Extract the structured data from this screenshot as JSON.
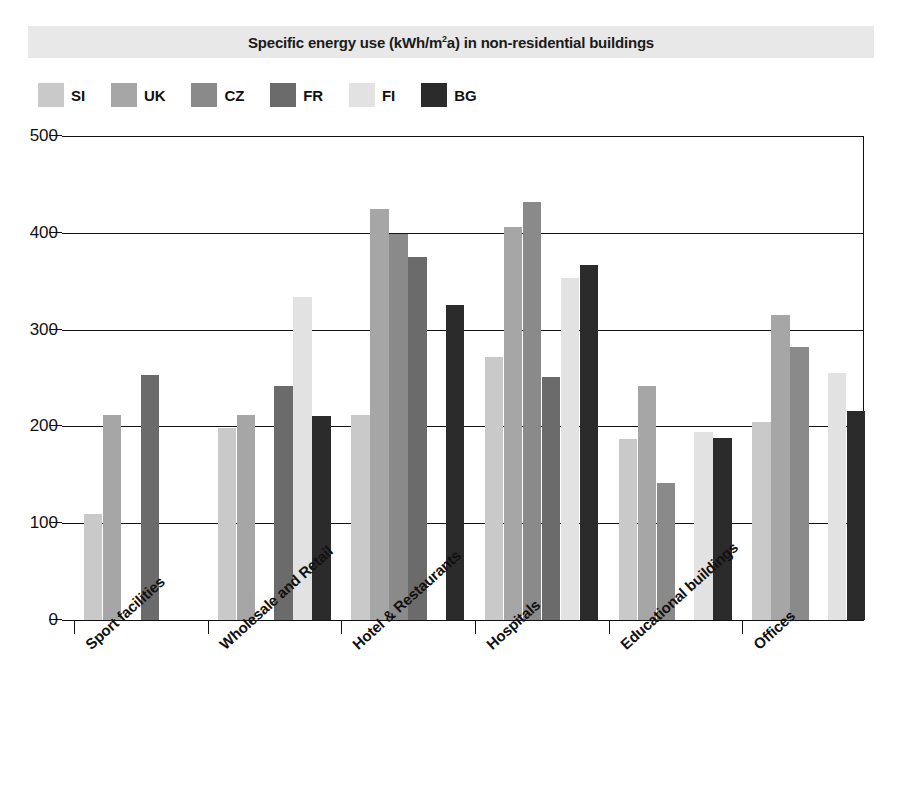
{
  "chart": {
    "title_prefix": "Specific energy use (kWh/m",
    "title_sup": "2",
    "title_suffix": "a) in non-residential  buildings",
    "title_full": "Specific energy use (kWh/m2a) in non-residential  buildings"
  },
  "legend": {
    "position": "top-left",
    "items": [
      {
        "label": "SI",
        "color": "#c9c9c9"
      },
      {
        "label": "UK",
        "color": "#a6a6a6"
      },
      {
        "label": "CZ",
        "color": "#8a8a8a"
      },
      {
        "label": "FR",
        "color": "#6b6b6b"
      },
      {
        "label": "FI",
        "color": "#e2e2e2"
      },
      {
        "label": "BG",
        "color": "#2b2b2b"
      }
    ]
  },
  "yaxis": {
    "ticks": [
      "0",
      "100",
      "200",
      "300",
      "400",
      "500"
    ],
    "min": 0,
    "max": 500,
    "step": 100
  },
  "chart_data": {
    "type": "bar",
    "title": "Specific energy use (kWh/m2a) in non-residential  buildings",
    "xlabel": "",
    "ylabel": "",
    "ylim": [
      0,
      500
    ],
    "grid": true,
    "legend_position": "top-left",
    "categories": [
      "Sport facilities",
      "Wholesale and Retail",
      "Hotel & Restaurants",
      "Hospitals",
      "Educational buildings",
      "Offices"
    ],
    "series": [
      {
        "name": "SI",
        "color": "#c9c9c9",
        "values": [
          110,
          198,
          212,
          272,
          187,
          205
        ]
      },
      {
        "name": "UK",
        "color": "#a6a6a6",
        "values": [
          212,
          212,
          425,
          406,
          242,
          315
        ]
      },
      {
        "name": "CZ",
        "color": "#8a8a8a",
        "values": [
          null,
          null,
          399,
          432,
          142,
          282
        ]
      },
      {
        "name": "FR",
        "color": "#6b6b6b",
        "values": [
          253,
          242,
          375,
          251,
          null,
          null
        ]
      },
      {
        "name": "FI",
        "color": "#e2e2e2",
        "values": [
          null,
          334,
          null,
          353,
          194,
          255
        ]
      },
      {
        "name": "BG",
        "color": "#2b2b2b",
        "values": [
          null,
          211,
          325,
          367,
          188,
          216
        ]
      }
    ]
  }
}
